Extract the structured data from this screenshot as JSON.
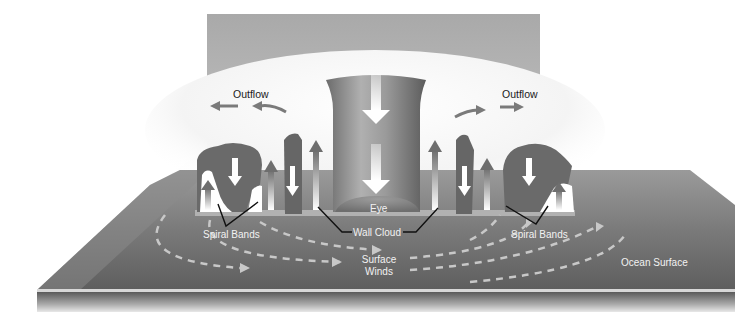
{
  "labels": {
    "outflow_left": "Outflow",
    "outflow_right": "Outflow",
    "eye": "Eye",
    "wall_cloud": "Wall Cloud",
    "spiral_bands_left": "Spiral Bands",
    "spiral_bands_right": "Spiral Bands",
    "surface_winds_line1": "Surface",
    "surface_winds_line2": "Winds",
    "ocean_surface": "Ocean Surface"
  },
  "colors": {
    "background": "#ffffff",
    "sky_panel": "#b8b8b8",
    "ocean_top": "#6f6f6f",
    "ocean_edge": "#d8d8d8",
    "cloud_gray": "#6a6a6a",
    "eye_column": "#8a8a8a",
    "arrow_white": "#ffffff",
    "arrow_gray": "#7a7a7a",
    "wind_dash": "#c4c4c4",
    "label_line": "#111111"
  }
}
